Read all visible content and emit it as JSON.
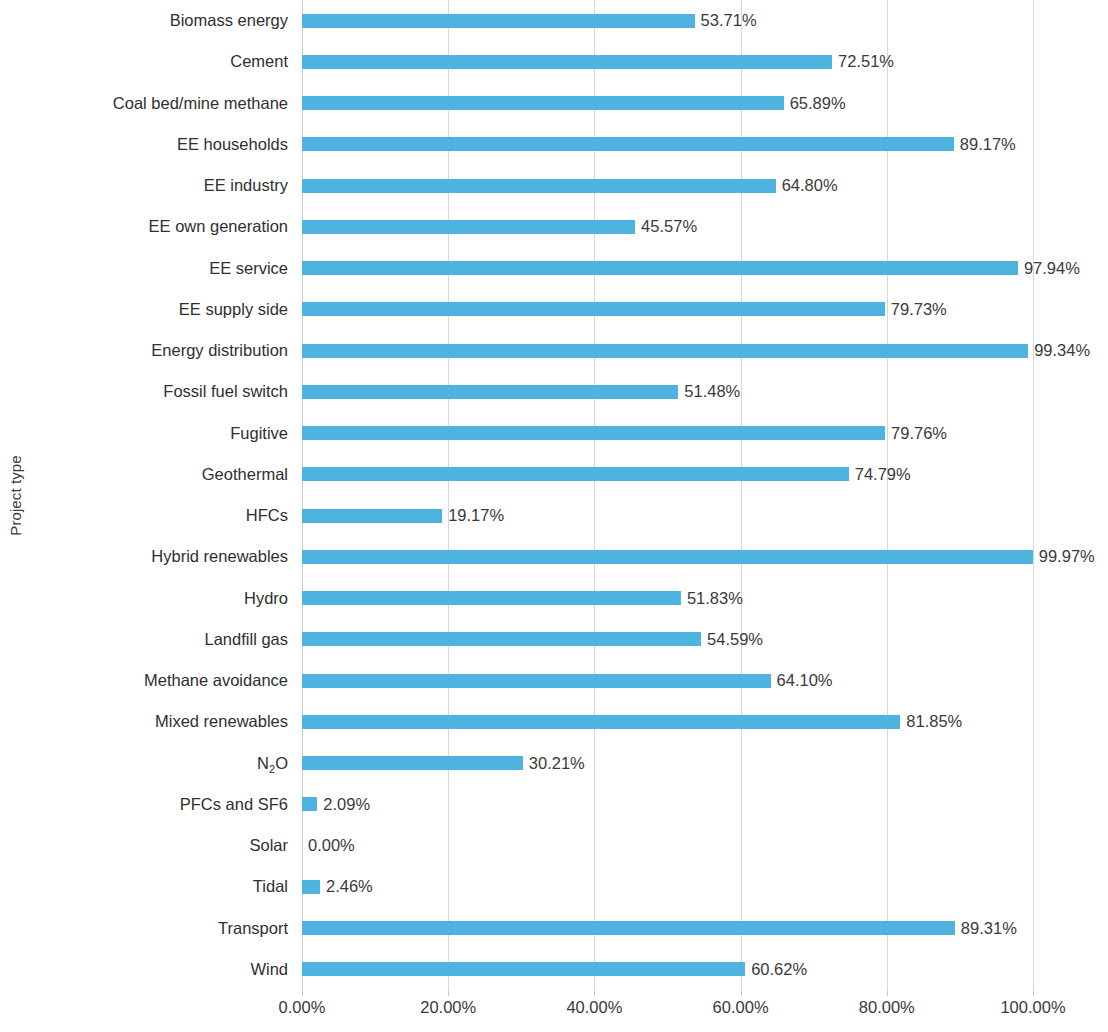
{
  "chart_data": {
    "type": "bar",
    "orientation": "horizontal",
    "title": "",
    "xlabel": "",
    "ylabel": "Project type",
    "xlim": [
      0,
      100
    ],
    "x_tick_labels": [
      "0.00%",
      "20.00%",
      "40.00%",
      "60.00%",
      "80.00%",
      "100.00%"
    ],
    "x_ticks": [
      0,
      20,
      40,
      60,
      80,
      100
    ],
    "grid": "vertical",
    "legend": "none",
    "bar_color": "#4fb3e0",
    "label_format": "percent_2dp",
    "categories": [
      "Biomass energy",
      "Cement",
      "Coal bed/mine methane",
      "EE households",
      "EE industry",
      "EE own generation",
      "EE service",
      "EE supply side",
      "Energy distribution",
      "Fossil fuel switch",
      "Fugitive",
      "Geothermal",
      "HFCs",
      "Hybrid renewables",
      "Hydro",
      "Landfill gas",
      "Methane avoidance",
      "Mixed renewables",
      "N2O",
      "PFCs and SF6",
      "Solar",
      "Tidal",
      "Transport",
      "Wind"
    ],
    "values": [
      53.71,
      72.51,
      65.89,
      89.17,
      64.8,
      45.57,
      97.94,
      79.73,
      99.34,
      51.48,
      79.76,
      74.79,
      19.17,
      99.97,
      51.83,
      54.59,
      64.1,
      81.85,
      30.21,
      2.09,
      0.0,
      2.46,
      89.31,
      60.62
    ],
    "value_labels": [
      "53.71%",
      "72.51%",
      "65.89%",
      "89.17%",
      "64.80%",
      "45.57%",
      "97.94%",
      "79.73%",
      "99.34%",
      "51.48%",
      "79.76%",
      "74.79%",
      "19.17%",
      "99.97%",
      "51.83%",
      "54.59%",
      "64.10%",
      "81.85%",
      "30.21%",
      "2.09%",
      "0.00%",
      "2.46%",
      "89.31%",
      "60.62%"
    ],
    "category_labels_html": [
      "Biomass energy",
      "Cement",
      "Coal bed/mine methane",
      "EE households",
      "EE industry",
      "EE own generation",
      "EE service",
      "EE supply side",
      "Energy distribution",
      "Fossil fuel switch",
      "Fugitive",
      "Geothermal",
      "HFCs",
      "Hybrid renewables",
      "Hydro",
      "Landfill gas",
      "Methane avoidance",
      "Mixed renewables",
      "N<sub>2</sub>O",
      "PFCs and SF6",
      "Solar",
      "Tidal",
      "Transport",
      "Wind"
    ]
  }
}
